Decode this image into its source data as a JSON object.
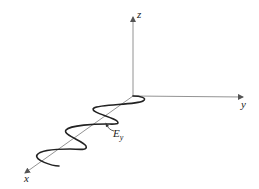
{
  "diagram": {
    "axes": {
      "x": {
        "label": "x"
      },
      "y": {
        "label": "y"
      },
      "z": {
        "label": "z"
      }
    },
    "wave": {
      "label_main": "E",
      "label_sub": "y",
      "cycles": 3,
      "propagation_axis": "x",
      "oscillation_axis": "y"
    },
    "colors": {
      "axis": "#777777",
      "wave": "#222222",
      "background": "#ffffff"
    }
  }
}
